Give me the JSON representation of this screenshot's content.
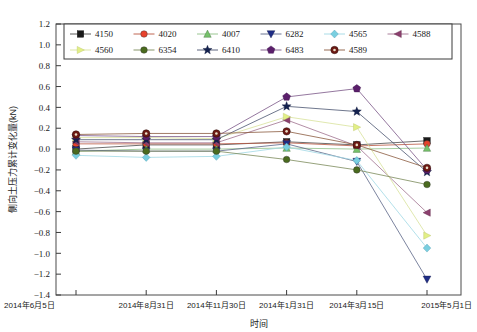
{
  "chart_data": {
    "type": "line",
    "title": "",
    "xlabel": "时间",
    "ylabel": "侧向土压力累计变化量(kN)",
    "grid": false,
    "legend_position": "top-inside",
    "ylim": [
      -1.4,
      1.2
    ],
    "ytick_labels": [
      "1.2",
      "1.0",
      "0.8",
      "0.6",
      "0.4",
      "0.2",
      "0.0",
      "-0.2",
      "-0.4",
      "-0.6",
      "-0.8",
      "-1.0",
      "-1.2",
      "-1.4"
    ],
    "ytick_values": [
      1.2,
      1.0,
      0.8,
      0.6,
      0.4,
      0.2,
      0.0,
      -0.2,
      -0.4,
      -0.6,
      -0.8,
      -1.0,
      -1.2,
      -1.4
    ],
    "categories": [
      "2014年6月5日",
      "2014年8月31日",
      "2014年11月30日",
      "2014年1月31日",
      "2014年3月15日",
      "2015年5月1日"
    ],
    "series": [
      {
        "name": "4150",
        "marker": "square",
        "color": "#1a1a1a",
        "line_color": "#4a4a4a",
        "values": [
          0.0,
          0.04,
          0.04,
          0.07,
          0.04,
          0.08
        ]
      },
      {
        "name": "4020",
        "marker": "circle",
        "color": "#e8422c",
        "line_color": "#b9563f",
        "values": [
          0.05,
          0.05,
          0.05,
          0.06,
          0.03,
          0.05
        ]
      },
      {
        "name": "4007",
        "marker": "triangle-up",
        "color": "#76c26b",
        "line_color": "#8fbf86",
        "values": [
          -0.02,
          0.0,
          0.0,
          0.01,
          0.0,
          0.01
        ]
      },
      {
        "name": "6282",
        "marker": "triangle-down",
        "color": "#1f2d86",
        "line_color": "#5a6486",
        "values": [
          -0.01,
          -0.02,
          -0.02,
          0.05,
          -0.12,
          -1.25
        ]
      },
      {
        "name": "4565",
        "marker": "diamond",
        "color": "#79cfe0",
        "line_color": "#9fd8e4",
        "values": [
          -0.06,
          -0.08,
          -0.07,
          0.02,
          -0.11,
          -0.95
        ]
      },
      {
        "name": "4588",
        "marker": "triangle-left",
        "color": "#8c3f6e",
        "line_color": "#a0718e",
        "values": [
          0.07,
          0.06,
          0.06,
          0.28,
          0.03,
          -0.61
        ]
      },
      {
        "name": "4560",
        "marker": "triangle-right",
        "color": "#e2ef86",
        "line_color": "#d8e29a",
        "values": [
          0.11,
          0.11,
          0.1,
          0.31,
          0.21,
          -0.83
        ]
      },
      {
        "name": "6354",
        "marker": "circle",
        "color": "#4a6b1e",
        "line_color": "#7b8a5a",
        "values": [
          -0.02,
          -0.02,
          -0.02,
          -0.1,
          -0.2,
          -0.34
        ]
      },
      {
        "name": "6410",
        "marker": "star",
        "color": "#14224f",
        "line_color": "#4a5470",
        "values": [
          0.09,
          0.09,
          0.09,
          0.41,
          0.36,
          -0.22
        ]
      },
      {
        "name": "6483",
        "marker": "pentagon",
        "color": "#5b1f6b",
        "line_color": "#7a5586",
        "values": [
          0.13,
          0.12,
          0.12,
          0.5,
          0.58,
          -0.2
        ]
      },
      {
        "name": "4589",
        "marker": "circle-dot",
        "color": "#6e1a14",
        "line_color": "#8a5a3f",
        "values": [
          0.14,
          0.15,
          0.15,
          0.17,
          0.04,
          -0.18
        ]
      }
    ]
  },
  "legend": {
    "row1": [
      "4150",
      "4020",
      "4007",
      "6282",
      "4565",
      "4588"
    ],
    "row2": [
      "4560",
      "6354",
      "6410",
      "6483",
      "4589"
    ]
  }
}
